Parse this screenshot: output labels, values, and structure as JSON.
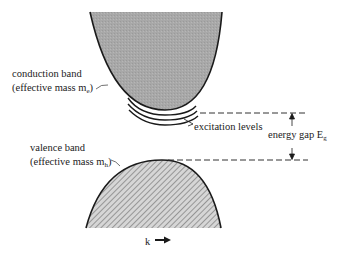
{
  "diagram": {
    "conduction_band": {
      "label_line1": "conduction band",
      "label_line2_prefix": "(effective mass m",
      "label_line2_sub": "e",
      "label_line2_suffix": ")",
      "fill_color": "#a9a9a9"
    },
    "valence_band": {
      "label_line1": "valence band",
      "label_line2_prefix": "(effective mass m",
      "label_line2_sub": "h",
      "label_line2_suffix": ")",
      "fill_color": "#c8c8c8"
    },
    "excitation_levels": {
      "label": "excitation levels",
      "count": 3
    },
    "energy_gap": {
      "label_prefix": "energy gap E",
      "label_sub": "g"
    },
    "k_axis": {
      "label": "k"
    },
    "line_color": "#1a1a1a"
  }
}
